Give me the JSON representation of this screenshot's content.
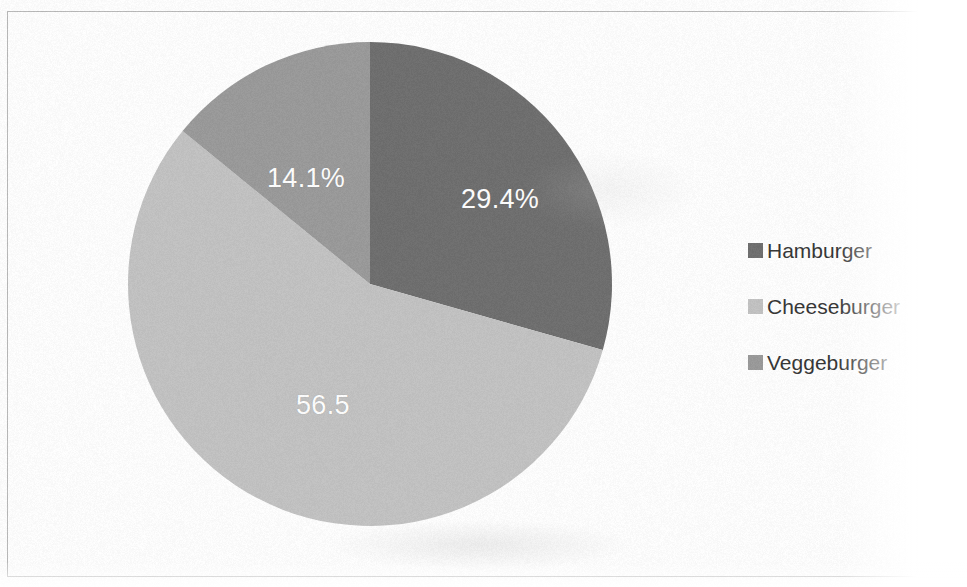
{
  "chart_data": {
    "type": "pie",
    "title": "",
    "subtitle": "",
    "xlabel": "",
    "ylabel": "",
    "categories": [
      "Hamburger",
      "Cheeseburger",
      "Veggeburger"
    ],
    "values": [
      29.4,
      56.5,
      14.1
    ],
    "data_labels": [
      "29.4%",
      "56.5",
      "14.1%"
    ],
    "colors": [
      "#6e6e6e",
      "#c3c3c3",
      "#9a9a9a"
    ],
    "start_angle_deg": 0,
    "direction": "clockwise",
    "legend_position": "right",
    "grid": false,
    "slices": [
      {
        "name": "Hamburger",
        "value": 29.4,
        "label": "29.4%",
        "color": "#6e6e6e",
        "start_deg": 0,
        "end_deg": 105.84
      },
      {
        "name": "Cheeseburger",
        "value": 56.5,
        "label": "56.5",
        "color": "#c3c3c3",
        "start_deg": 105.84,
        "end_deg": 309.24
      },
      {
        "name": "Veggeburger",
        "value": 14.1,
        "label": "14.1%",
        "color": "#9a9a9a",
        "start_deg": 309.24,
        "end_deg": 360
      }
    ]
  },
  "legend": {
    "items": [
      {
        "label": "Hamburger",
        "color": "#6e6e6e"
      },
      {
        "label": "Cheeseburger",
        "color": "#c3c3c3"
      },
      {
        "label": "Veggeburger",
        "color": "#9a9a9a"
      }
    ]
  },
  "labels": {
    "hamburger": "29.4%",
    "cheeseburger": "56.5",
    "veggeburger": "14.1%"
  }
}
